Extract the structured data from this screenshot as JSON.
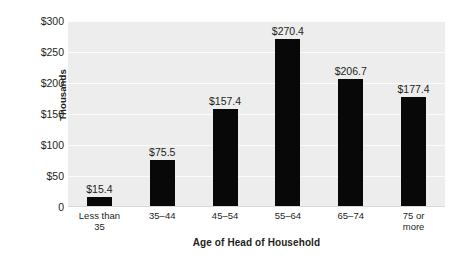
{
  "chart_data": {
    "type": "bar",
    "title": "",
    "xlabel": "Age of Head of Household",
    "ylabel": "Thousands",
    "categories": [
      "Less than 35",
      "35–44",
      "45–54",
      "55–64",
      "65–74",
      "75 or more"
    ],
    "category_lines": [
      [
        "Less than",
        "35"
      ],
      [
        "35–44"
      ],
      [
        "45–54"
      ],
      [
        "55–64"
      ],
      [
        "65–74"
      ],
      [
        "75 or",
        "more"
      ]
    ],
    "values": [
      15.4,
      75.5,
      157.4,
      270.4,
      206.7,
      177.4
    ],
    "value_labels": [
      "$15.4",
      "$75.5",
      "$157.4",
      "$270.4",
      "$206.7",
      "$177.4"
    ],
    "ylim": [
      0,
      300
    ],
    "ytick_values": [
      300,
      250,
      200,
      150,
      100,
      50,
      0
    ],
    "ytick_labels": [
      "$300",
      "$250",
      "$200",
      "$150",
      "$100",
      "$50",
      "0"
    ],
    "grid": true,
    "legend": false,
    "bar_color": "#080808",
    "plot_background": "#ededed",
    "gridline_color": "#fbfbfb",
    "page_background": "#ffffff",
    "text_color": "#231f20"
  }
}
